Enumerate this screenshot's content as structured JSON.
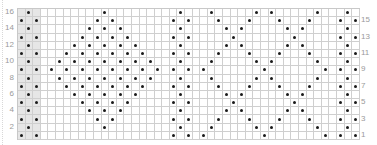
{
  "chart": {
    "columns": 45,
    "rows": 16,
    "shaded_columns": [
      0,
      1,
      2
    ],
    "left_labels": [
      "16",
      "14",
      "12",
      "10",
      "8",
      "6",
      "4",
      "2"
    ],
    "right_labels": [
      "15",
      "13",
      "11",
      "9",
      "7",
      "5",
      "3",
      "1"
    ],
    "colors": {
      "grid": "#cfcfcf",
      "shade": "#e6e6e6",
      "dot": "#1a1a1a",
      "label": "#9a9a9a"
    },
    "dots_by_row": {
      "16": [
        1,
        11,
        21,
        25,
        31,
        33,
        39,
        43
      ],
      "15": [
        0,
        2,
        10,
        12,
        20,
        22,
        26,
        30,
        34,
        38,
        42,
        44
      ],
      "14": [
        1,
        9,
        11,
        13,
        21,
        27,
        29,
        35,
        37,
        43
      ],
      "13": [
        0,
        2,
        8,
        10,
        12,
        14,
        20,
        22,
        28,
        36,
        42,
        44
      ],
      "12": [
        1,
        7,
        9,
        11,
        13,
        15,
        21,
        27,
        29,
        35,
        37,
        43
      ],
      "11": [
        0,
        2,
        6,
        8,
        10,
        12,
        14,
        16,
        20,
        22,
        26,
        30,
        34,
        38,
        42,
        44
      ],
      "10": [
        1,
        5,
        7,
        9,
        11,
        13,
        15,
        17,
        21,
        25,
        31,
        33,
        39,
        43
      ],
      "9": [
        0,
        2,
        4,
        6,
        8,
        10,
        12,
        14,
        16,
        18,
        20,
        22,
        24,
        32,
        40,
        42,
        44
      ],
      "8": [
        1,
        5,
        7,
        9,
        11,
        13,
        15,
        17,
        21,
        25,
        31,
        33,
        39,
        43
      ],
      "7": [
        0,
        2,
        6,
        8,
        10,
        12,
        14,
        16,
        20,
        22,
        26,
        30,
        34,
        38,
        42,
        44
      ],
      "6": [
        1,
        7,
        9,
        11,
        13,
        15,
        21,
        27,
        29,
        35,
        37,
        43
      ],
      "5": [
        0,
        2,
        8,
        10,
        12,
        14,
        20,
        22,
        28,
        36,
        42,
        44
      ],
      "4": [
        1,
        9,
        11,
        13,
        21,
        27,
        29,
        35,
        37,
        43
      ],
      "3": [
        0,
        2,
        10,
        12,
        20,
        22,
        26,
        30,
        34,
        38,
        42,
        44
      ],
      "2": [
        1,
        11,
        21,
        25,
        31,
        33,
        39,
        43
      ],
      "1": [
        0,
        2,
        20,
        22,
        24,
        32,
        40,
        42,
        44
      ]
    }
  }
}
